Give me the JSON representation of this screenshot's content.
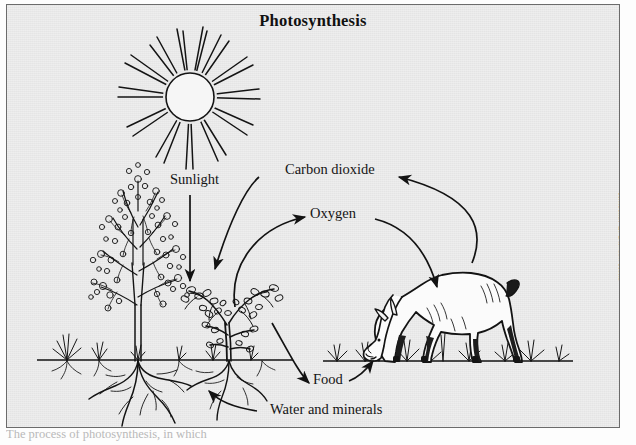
{
  "figure": {
    "title": "Photosynthesis",
    "background_color": "#e9e9e9",
    "border_color": "#6b6b6b",
    "ink_color": "#111111",
    "credit": "Kimberly L. Dawson Kurz"
  },
  "labels": {
    "sunlight": "Sunlight",
    "carbon_dioxide": "Carbon dioxide",
    "oxygen": "Oxygen",
    "food": "Food",
    "water_and_minerals": "Water and minerals"
  },
  "caption": {
    "text": "The process of photosynthesis, in which"
  },
  "diagram_data": {
    "type": "cycle-diagram",
    "subject": "Photosynthesis cycle between plants and an animal",
    "nodes": [
      {
        "id": "sun",
        "name": "sun",
        "kind": "illustration"
      },
      {
        "id": "tree",
        "name": "flowering-tree",
        "kind": "illustration"
      },
      {
        "id": "shrub",
        "name": "small-shrub",
        "kind": "illustration"
      },
      {
        "id": "roots",
        "name": "plant-roots",
        "kind": "illustration"
      },
      {
        "id": "deer",
        "name": "grazing-deer",
        "kind": "illustration"
      },
      {
        "id": "grass",
        "name": "ground-line-with-grass",
        "kind": "illustration"
      }
    ],
    "flows": [
      {
        "label": "Sunlight",
        "from": "sun",
        "to": "shrub",
        "arrow": "straight-down"
      },
      {
        "label": "Oxygen",
        "from": "shrub",
        "to": "deer",
        "arrow": "inner-arc"
      },
      {
        "label": "Carbon dioxide",
        "from": "deer",
        "to": "shrub",
        "arrow": "outer-arc"
      },
      {
        "label": "Food",
        "from": "shrub",
        "to": "deer",
        "arrow": "lower-arc"
      },
      {
        "label": "Water and minerals",
        "from": "soil",
        "to": "roots",
        "arrow": "curve-up-left"
      }
    ]
  }
}
